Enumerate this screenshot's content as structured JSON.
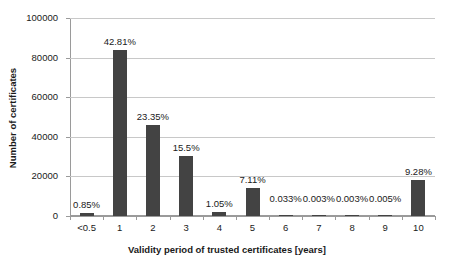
{
  "chart_data": {
    "type": "bar",
    "title": "",
    "xlabel": "Validity period of trusted certificates [years]",
    "ylabel": "Number of certificates",
    "categories": [
      "<0.5",
      "1",
      "2",
      "3",
      "4",
      "5",
      "6",
      "7",
      "8",
      "9",
      "10"
    ],
    "values": [
      1670,
      84000,
      45800,
      30400,
      2060,
      13950,
      65,
      6,
      6,
      10,
      18200
    ],
    "data_labels": [
      "0.85%",
      "42.81%",
      "23.35%",
      "15.5%",
      "1.05%",
      "7.11%",
      "0.033%",
      "0.003%",
      "0.003%",
      "0.005%",
      "9.28%"
    ],
    "percentages": [
      0.85,
      42.81,
      23.35,
      15.5,
      1.05,
      7.11,
      0.033,
      0.003,
      0.003,
      0.005,
      9.28
    ],
    "ylim": [
      0,
      100000
    ],
    "yticks": [
      "0",
      "20000",
      "40000",
      "60000",
      "80000",
      "100000"
    ],
    "ytick_values": [
      0,
      20000,
      40000,
      60000,
      80000,
      100000
    ],
    "grid": true,
    "legend": "none",
    "bar_color": "#434343",
    "grid_color": "#c8c8c8",
    "axis_color": "#9a9a9a",
    "background": "#ffffff"
  }
}
